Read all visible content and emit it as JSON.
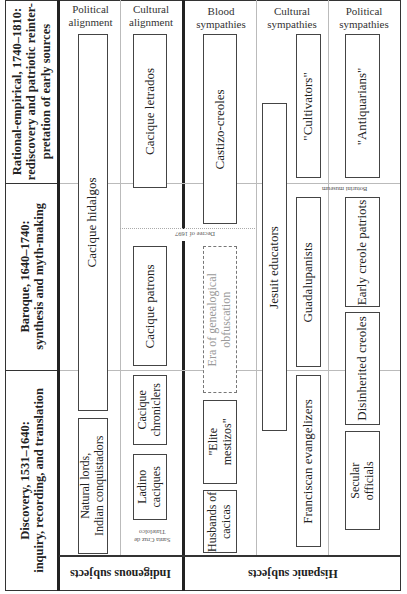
{
  "periods": [
    {
      "label_line1": "Rational-empirical, 1740–1810:",
      "label_line2": "rediscovery and patriotic reinter-",
      "label_line3": "pretation of early sources"
    },
    {
      "label_line1": "Baroque, 1640–1740:",
      "label_line2": "synthesis and myth-making"
    },
    {
      "label_line1": "Discovery, 1531–1640:",
      "label_line2": "inquiry, recording, and translation"
    }
  ],
  "subjects": {
    "indigenous": "Indigenous subjects",
    "hispanic": "Hispanic subjects"
  },
  "column_headers": {
    "indigenous_political": "Political alignment",
    "indigenous_cultural": "Cultural alignment",
    "hispanic_blood": "Blood sympathies",
    "hispanic_cultural": "Cultural sympathies",
    "hispanic_political": "Political sympathies"
  },
  "groups": {
    "cacique_hidalgos": "Cacique hidalgos",
    "natural_lords_l1": "Natural lords,",
    "natural_lords_l2": "Indian conquistadors",
    "cacique_letrados": "Cacique letrados",
    "cacique_patrons": "Cacique patrons",
    "cacique_chroniclers_l1": "Cacique",
    "cacique_chroniclers_l2": "chroniclers",
    "ladino_caciques_l1": "Ladino",
    "ladino_caciques_l2": "caciques",
    "castizo_creoles": "Castizo-creoles",
    "era_obfuscation_l1": "Era of genealogical",
    "era_obfuscation_l2": "obfuscation",
    "elite_mestizos_l1": "\"Elite",
    "elite_mestizos_l2": "mestizos\"",
    "husbands_cacicas_l1": "Husbands of",
    "husbands_cacicas_l2": "cacicas",
    "cultivators": "\"Cultivators\"",
    "jesuit_educators": "Jesuit educators",
    "guadalupanists": "Guadalupanists",
    "franciscan_evangelizers": "Franciscan evangelizers",
    "antiquarians": "\"Antiquarians\"",
    "early_creole_patriots": "Early creole patriots",
    "disinherited_creoles": "Disinherited creoles",
    "secular_officials_l1": "Secular",
    "secular_officials_l2": "officials"
  },
  "annotations": {
    "decree": "Decree of 1697",
    "boturini": "Boturini museum",
    "santa_cruz_l1": "Santa Cruz de",
    "santa_cruz_l2": "Tlatelolco"
  }
}
